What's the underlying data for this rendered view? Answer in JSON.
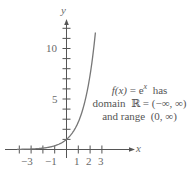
{
  "chart_data": {
    "type": "line",
    "title": "",
    "function": "f(x) = e^x",
    "xlabel": "x",
    "ylabel": "y",
    "xlim": [
      -5,
      5.5
    ],
    "ylim": [
      0,
      12.5
    ],
    "grid": false,
    "x_ticks": [
      -4,
      -3,
      -2,
      -1,
      1,
      2,
      3
    ],
    "x_tick_labels": [
      {
        "value": -3,
        "label": "−3"
      },
      {
        "value": -1,
        "label": "−1"
      },
      {
        "value": 1,
        "label": "1"
      },
      {
        "value": 2,
        "label": "2"
      },
      {
        "value": 3,
        "label": "3"
      }
    ],
    "y_ticks": [
      1,
      2,
      3,
      4,
      5,
      6,
      7,
      8,
      9,
      10,
      11,
      12
    ],
    "y_tick_labels": [
      {
        "value": 5,
        "label": "5"
      },
      {
        "value": 10,
        "label": "10"
      }
    ],
    "series": [
      {
        "name": "f(x) = e^x",
        "x": [
          -5,
          -4,
          -3,
          -2,
          -1,
          -0.5,
          0,
          0.5,
          1,
          1.5,
          2,
          2.25,
          2.48
        ],
        "y": [
          0.0067,
          0.018,
          0.05,
          0.135,
          0.368,
          0.607,
          1,
          1.649,
          2.718,
          4.482,
          7.389,
          9.488,
          11.94
        ]
      }
    ],
    "annotations": [
      {
        "line1": "f(x) = e^x  has",
        "line2": "domain  ℝ = (−∞, ∞)",
        "line3": "and range  (0, ∞)"
      }
    ]
  },
  "labels": {
    "x_axis": "x",
    "y_axis": "y",
    "x_ticks": [
      "−3",
      "−1",
      "1",
      "2",
      "3"
    ],
    "y_ticks": [
      "5",
      "10"
    ]
  },
  "annotation": {
    "func_lhs": "f(x)",
    "func_eq": " = e",
    "func_exp": "x",
    "func_tail": "  has",
    "line2": "domain  ℝ = (−∞, ∞)",
    "line3": "and range  (0, ∞)"
  },
  "style": {
    "axis_color": "#555555",
    "curve_color": "#777777"
  }
}
